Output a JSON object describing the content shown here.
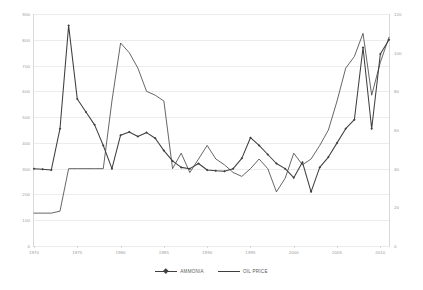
{
  "chart_data": {
    "type": "line",
    "title": "",
    "subtitle": "",
    "xlabel": "",
    "ylabel": "",
    "grid": true,
    "legend_position": "bottom",
    "x": [
      1970,
      1971,
      1972,
      1973,
      1974,
      1975,
      1976,
      1977,
      1978,
      1979,
      1980,
      1981,
      1982,
      1983,
      1984,
      1985,
      1986,
      1987,
      1988,
      1989,
      1990,
      1991,
      1992,
      1993,
      1994,
      1995,
      1996,
      1997,
      1998,
      1999,
      2000,
      2001,
      2002,
      2003,
      2004,
      2005,
      2006,
      2007,
      2008,
      2009,
      2010,
      2011
    ],
    "xtick_labels": [
      "1970",
      "1975",
      "1980",
      "1985",
      "1990",
      "1995",
      "2000",
      "2005",
      "2010"
    ],
    "xtick_values": [
      1970,
      1975,
      1980,
      1985,
      1990,
      1995,
      2000,
      2005,
      2010
    ],
    "xlim": [
      1970,
      2011
    ],
    "left_axis": {
      "name": "AMMONIA",
      "ylim": [
        0,
        900
      ],
      "ticks": [
        0,
        100,
        200,
        300,
        400,
        500,
        600,
        700,
        800,
        900
      ],
      "tick_labels": [
        "0",
        "100",
        "200",
        "300",
        "400",
        "500",
        "600",
        "700",
        "800",
        "900"
      ]
    },
    "right_axis": {
      "name": "OIL PRICE",
      "ylim": [
        0,
        120
      ],
      "ticks": [
        0,
        20,
        40,
        60,
        80,
        100,
        120
      ],
      "tick_labels": [
        "0",
        "20",
        "40",
        "60",
        "80",
        "100",
        "120"
      ]
    },
    "series": [
      {
        "name": "AMMONIA",
        "axis": "left",
        "color": "#3f3f3f",
        "marker": "diamond",
        "values": [
          300,
          298,
          295,
          455,
          855,
          570,
          520,
          470,
          390,
          300,
          430,
          442,
          425,
          440,
          418,
          370,
          330,
          305,
          300,
          320,
          295,
          292,
          290,
          300,
          340,
          420,
          390,
          355,
          320,
          300,
          265,
          325,
          210,
          305,
          345,
          400,
          455,
          490,
          770,
          455,
          745,
          800
        ]
      },
      {
        "name": "OIL PRICE",
        "axis": "right",
        "color": "#3f3f3f",
        "marker": "none",
        "values": [
          17,
          17,
          17,
          18,
          40,
          40,
          40,
          40,
          40,
          75,
          105,
          100,
          92,
          80,
          78,
          75,
          40,
          48,
          38,
          45,
          52,
          45,
          42,
          38,
          36,
          40,
          45,
          40,
          28,
          35,
          48,
          42,
          45,
          52,
          60,
          75,
          92,
          98,
          110,
          78,
          95,
          108
        ]
      }
    ]
  },
  "legend": {
    "entries": [
      {
        "label": "AMMONIA"
      },
      {
        "label": "OIL PRICE"
      }
    ]
  },
  "colors": {
    "series_line": "#3f3f3f",
    "gridline": "#ececed",
    "axis": "#d9d9d9",
    "tick_text": "#9a9a9a",
    "legend_text": "#5a5a5a"
  }
}
